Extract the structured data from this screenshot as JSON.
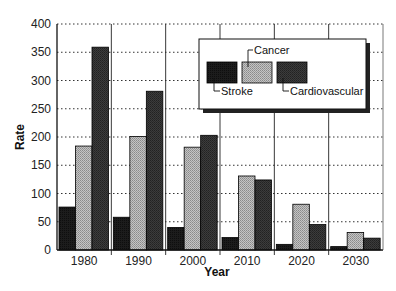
{
  "chart_data": {
    "type": "bar",
    "title": "",
    "xlabel": "Year",
    "ylabel": "Rate",
    "categories": [
      "1980",
      "1990",
      "2000",
      "2010",
      "2020",
      "2030"
    ],
    "series": [
      {
        "name": "Stroke",
        "color": "#1a1a1a",
        "values": [
          76,
          58,
          40,
          22,
          10,
          6
        ]
      },
      {
        "name": "Cancer",
        "color": "#b0b0b0",
        "values": [
          184,
          201,
          182,
          131,
          81,
          31
        ]
      },
      {
        "name": "Cardiovascular",
        "color": "#3a3a3a",
        "values": [
          359,
          281,
          203,
          124,
          45,
          21
        ]
      }
    ],
    "ylim": [
      0,
      400
    ],
    "yticks": [
      0,
      50,
      100,
      150,
      200,
      250,
      300,
      350,
      400
    ],
    "grid": {
      "horizontal": "dotted",
      "vertical_separators": true
    },
    "legend_position": "upper right (inset box with drop shadow)"
  },
  "legend": {
    "stroke_label": "Stroke",
    "cancer_label": "Cancer",
    "cardiovascular_label": "Cardiovascular"
  },
  "axes": {
    "x_title": "Year",
    "y_title": "Rate"
  }
}
